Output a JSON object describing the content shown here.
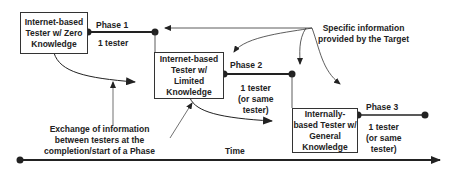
{
  "diagram": {
    "testers": [
      {
        "label": "Internet-based Tester w/ Zero Knowledge",
        "lines": [
          "Internet-based",
          "Tester w/ Zero",
          "Knowledge"
        ]
      },
      {
        "label": "Internet-based Tester w/ Limited Knowledge",
        "lines": [
          "Internet-based",
          "Tester w/",
          "Limited",
          "Knowledge"
        ]
      },
      {
        "label": "Internally-based Tester w/ General Knowledge",
        "lines": [
          "Internally-",
          "based Tester w/",
          "General",
          "Knowledge"
        ]
      }
    ],
    "phases": [
      {
        "name": "Phase 1",
        "testers": [
          "1 tester"
        ]
      },
      {
        "name": "Phase 2",
        "testers": [
          "1 tester",
          "(or same",
          "tester)"
        ]
      },
      {
        "name": "Phase 3",
        "testers": [
          "1 tester",
          "(or same",
          "tester)"
        ]
      }
    ],
    "target_info": [
      "Specific information",
      "provided by the Target"
    ],
    "exchange_info": [
      "Exchange of information",
      "between testers at the",
      "completion/start of a Phase"
    ],
    "time_label": "Time"
  }
}
